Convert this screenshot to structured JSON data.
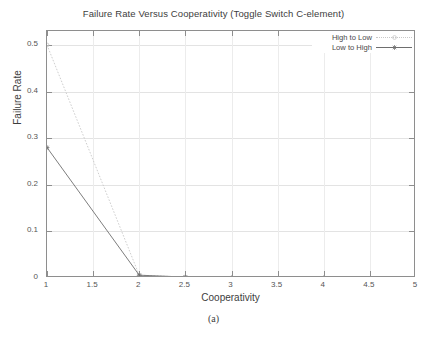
{
  "chart_data": {
    "type": "line",
    "title": "Failure Rate Versus Cooperativity (Toggle Switch C-element)",
    "xlabel": "Cooperativity",
    "ylabel": "Failure Rate",
    "caption": "(a)",
    "grid": true,
    "legend_position": "top-right",
    "xlim": [
      1,
      5
    ],
    "ylim": [
      0,
      0.53
    ],
    "xticks": [
      1,
      1.5,
      2,
      2.5,
      3,
      3.5,
      4,
      4.5,
      5
    ],
    "xticklabels": [
      "1",
      "1.5",
      "2",
      "2.5",
      "3",
      "3.5",
      "4",
      "4.5",
      "5"
    ],
    "yticks": [
      0,
      0.1,
      0.2,
      0.3,
      0.4,
      0.5
    ],
    "yticklabels": [
      "0",
      "0.1",
      "0.2",
      "0.3",
      "0.4",
      "0.5"
    ],
    "x": [
      1,
      2,
      2.5,
      3,
      4,
      5
    ],
    "series": [
      {
        "name": "High to Low",
        "color": "#c8c8c8",
        "linestyle": "dotted",
        "marker": "circle",
        "values": [
          0.5,
          0.006,
          0.002,
          0.0,
          0.0,
          0.0
        ]
      },
      {
        "name": "Low to High",
        "color": "#6e6e6e",
        "linestyle": "solid",
        "marker": "star",
        "values": [
          0.28,
          0.006,
          0.002,
          0.0,
          0.0,
          0.0
        ]
      }
    ]
  },
  "legend": {
    "entries": [
      {
        "label": "High to Low"
      },
      {
        "label": "Low to High"
      }
    ]
  }
}
